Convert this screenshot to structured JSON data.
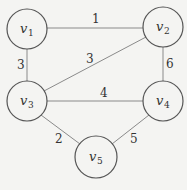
{
  "graph": {
    "nodes": [
      {
        "id": "v1",
        "label": "v",
        "sub": "1",
        "x": 27,
        "y": 29
      },
      {
        "id": "v2",
        "label": "v",
        "sub": "2",
        "x": 163,
        "y": 27
      },
      {
        "id": "v3",
        "label": "v",
        "sub": "3",
        "x": 27,
        "y": 101
      },
      {
        "id": "v4",
        "label": "v",
        "sub": "4",
        "x": 163,
        "y": 101
      },
      {
        "id": "v5",
        "label": "v",
        "sub": "5",
        "x": 96,
        "y": 157
      }
    ],
    "edges": [
      {
        "from": "v1",
        "to": "v2",
        "weight": "1"
      },
      {
        "from": "v1",
        "to": "v3",
        "weight": "3"
      },
      {
        "from": "v3",
        "to": "v2",
        "weight": "3"
      },
      {
        "from": "v2",
        "to": "v4",
        "weight": "6"
      },
      {
        "from": "v3",
        "to": "v4",
        "weight": "4"
      },
      {
        "from": "v3",
        "to": "v5",
        "weight": "2"
      },
      {
        "from": "v4",
        "to": "v5",
        "weight": "5"
      }
    ]
  }
}
